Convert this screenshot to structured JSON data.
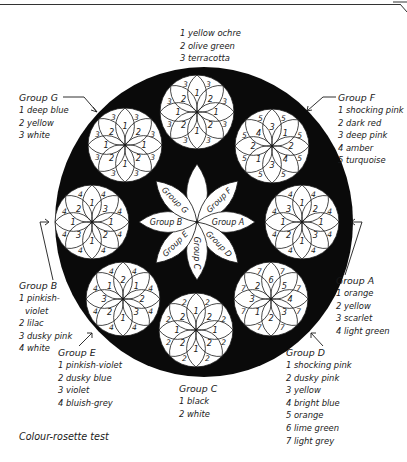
{
  "caption": "Colour-rosette test",
  "center_flower": {
    "petal_labels": [
      "Group F",
      "Group A",
      "Group D",
      "Group C",
      "Group E",
      "Group B",
      "Group G"
    ]
  },
  "rosettes": [
    {
      "id": "top",
      "cx": 197,
      "cy": 112,
      "outer": [
        "3",
        "3",
        "3",
        "3",
        "3",
        "3",
        "3",
        "3"
      ],
      "inner": [
        "1",
        "2",
        "1",
        "2",
        "1",
        "2",
        "1",
        "2"
      ]
    },
    {
      "id": "G",
      "cx": 125,
      "cy": 145,
      "outer": [
        "3",
        "3",
        "3",
        "3",
        "3",
        "3",
        "3",
        "3"
      ],
      "inner": [
        "1",
        "2",
        "1",
        "2",
        "1",
        "2",
        "1",
        "2"
      ]
    },
    {
      "id": "F",
      "cx": 272,
      "cy": 146,
      "outer": [
        "5",
        "5",
        "5",
        "5",
        "5",
        "5",
        "5",
        "5"
      ],
      "inner": [
        "3",
        "1",
        "2",
        "4",
        "3",
        "1",
        "2",
        "4"
      ]
    },
    {
      "id": "B",
      "cx": 92,
      "cy": 222,
      "outer": [
        "4",
        "4",
        "4",
        "4",
        "4",
        "4",
        "4",
        "4"
      ],
      "inner": [
        "1",
        "3",
        "1",
        "2",
        "1",
        "3",
        "1",
        "2"
      ]
    },
    {
      "id": "A",
      "cx": 302,
      "cy": 222,
      "outer": [
        "4",
        "4",
        "4",
        "4",
        "4",
        "4",
        "4",
        "4"
      ],
      "inner": [
        "1",
        "2",
        "1",
        "3",
        "1",
        "2",
        "1",
        "3"
      ]
    },
    {
      "id": "E",
      "cx": 123,
      "cy": 299,
      "outer": [
        "4",
        "4",
        "4",
        "4",
        "4",
        "4",
        "4",
        "4"
      ],
      "inner": [
        "2",
        "1",
        "2",
        "3",
        "1",
        "2",
        "3",
        "1"
      ]
    },
    {
      "id": "D",
      "cx": 271,
      "cy": 299,
      "outer": [
        "7",
        "7",
        "7",
        "7",
        "7",
        "7",
        "7",
        "7"
      ],
      "inner": [
        "6",
        "5",
        "4",
        "3",
        "2",
        "1",
        "3",
        "2"
      ]
    },
    {
      "id": "C",
      "cx": 196,
      "cy": 330,
      "outer": [
        "2",
        "2",
        "2",
        "2",
        "2",
        "2",
        "2",
        "2"
      ],
      "inner": [
        "1",
        "2",
        "1",
        "2",
        "1",
        "2",
        "1",
        "2"
      ]
    }
  ],
  "legends": {
    "top": {
      "title": "",
      "items": [
        "1 yellow ochre",
        "2 olive green",
        "3 terracotta"
      ]
    },
    "G": {
      "title": "Group G",
      "items": [
        "1 deep blue",
        "2 yellow",
        "3 white"
      ]
    },
    "F": {
      "title": "Group F",
      "items": [
        "1 shocking pink",
        "2 dark red",
        "3 deep pink",
        "4 amber",
        "5 turquoise"
      ]
    },
    "B": {
      "title": "Group B",
      "items": [
        "1 pinkish-",
        "violet",
        "2 lilac",
        "3 dusky pink",
        "4 white"
      ]
    },
    "A": {
      "title": "Group A",
      "items": [
        "1 orange",
        "2 yellow",
        "3 scarlet",
        "4 light green"
      ]
    },
    "E": {
      "title": "Group E",
      "items": [
        "1 pinkish-violet",
        "2 dusky blue",
        "3 violet",
        "4 bluish-grey"
      ]
    },
    "D": {
      "title": "Group D",
      "items": [
        "1 shocking pink",
        "2 dusky pink",
        "3 yellow",
        "4 bright blue",
        "5 orange",
        "6 lime green",
        "7 light grey"
      ]
    },
    "C": {
      "title": "Group C",
      "items": [
        "1 black",
        "2 white"
      ]
    }
  },
  "colors": {
    "ink": "#1a1a1a",
    "background": "#ffffff",
    "disc": "#0a0a0a",
    "petal": "#ffffff"
  }
}
